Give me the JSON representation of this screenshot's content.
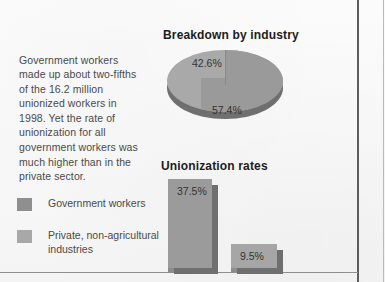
{
  "intro": {
    "text": "Government workers made up about two-fifths of the 16.2 million unionized workers in 1998. Yet the rate of unionization for all government workers was much higher than in the private sector."
  },
  "legend": {
    "items": [
      {
        "label": "Government workers",
        "color": "#8f8f8f"
      },
      {
        "label": "Private, non-agricultural industries",
        "color": "#a8a8a8"
      }
    ]
  },
  "chart_data": [
    {
      "type": "pie",
      "title": "Breakdown by industry",
      "categories": [
        "Government workers",
        "Private, non-agricultural industries"
      ],
      "values": [
        42.6,
        57.4
      ],
      "labels": [
        "42.6%",
        "57.4%"
      ],
      "colors": [
        "#a9a9a9",
        "#9a9a9a"
      ],
      "legend_position": "left",
      "grid": false
    },
    {
      "type": "bar",
      "title": "Unionization rates",
      "categories": [
        "Government workers",
        "Private, non-agricultural industries"
      ],
      "values": [
        37.5,
        9.5
      ],
      "labels": [
        "37.5%",
        "9.5%"
      ],
      "colors": [
        "#9b9b9b",
        "#a6a6a6"
      ],
      "xlabel": "",
      "ylabel": "",
      "ylim": [
        0,
        40
      ],
      "grid": false,
      "legend_position": "left"
    }
  ]
}
